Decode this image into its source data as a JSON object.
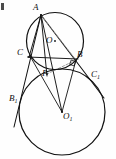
{
  "figure": {
    "background_color": "#fefefe",
    "stroke_color": "#111111",
    "dashed_color": "#8a8a8a",
    "corner_artifact": true,
    "circles": [
      {
        "name": "upper-circle",
        "center_label": "O",
        "cx": 55,
        "cy": 41,
        "r": 28.5,
        "stroke_width": 1.15
      },
      {
        "name": "lower-circle",
        "center_label": "O1",
        "cx": 62,
        "cy": 112,
        "r": 43,
        "stroke_width": 1.15
      }
    ],
    "points": [
      {
        "id": "A",
        "label": "A",
        "sub": "",
        "x": 41,
        "y": 15,
        "label_x": 34,
        "label_y": 4
      },
      {
        "id": "O",
        "label": "O",
        "sub": "",
        "x": 55,
        "y": 41,
        "label_x": 47,
        "label_y": 38
      },
      {
        "id": "C",
        "label": "C",
        "sub": "",
        "x": 30,
        "y": 56,
        "label_x": 19,
        "label_y": 48
      },
      {
        "id": "B",
        "label": "B",
        "sub": "",
        "x": 76,
        "y": 60,
        "label_x": 77,
        "label_y": 51
      },
      {
        "id": "C1",
        "label": "C",
        "sub": "1",
        "x": 90,
        "y": 74,
        "label_x": 92,
        "label_y": 69
      },
      {
        "id": "P",
        "label": "P",
        "sub": "",
        "x": 47,
        "y": 74,
        "label_x": 44,
        "label_y": 71
      },
      {
        "id": "B1",
        "label": "B",
        "sub": "1",
        "x": 19,
        "y": 99,
        "label_x": 10,
        "label_y": 95
      },
      {
        "id": "O1",
        "label": "O",
        "sub": "1",
        "x": 62,
        "y": 112,
        "label_x": 63,
        "label_y": 112
      }
    ],
    "segments": [
      {
        "name": "line-A-to-B1",
        "x1": 41,
        "y1": 15,
        "x2": 14,
        "y2": 127,
        "solid": true
      },
      {
        "name": "line-A-to-C1",
        "x1": 41,
        "y1": 15,
        "x2": 104,
        "y2": 98,
        "solid": true
      },
      {
        "name": "line-A-to-O1",
        "x1": 41,
        "y1": 15,
        "x2": 62,
        "y2": 112,
        "solid": true
      },
      {
        "name": "line-A-to-P",
        "x1": 41,
        "y1": 15,
        "x2": 47,
        "y2": 74,
        "solid": true
      },
      {
        "name": "line-A-to-C",
        "x1": 41,
        "y1": 15,
        "x2": 30,
        "y2": 56,
        "solid": true
      },
      {
        "name": "line-C-to-B",
        "x1": 28,
        "y1": 57,
        "x2": 78,
        "y2": 59,
        "solid": true
      },
      {
        "name": "line-A-to-B-dashed",
        "x1": 41,
        "y1": 15,
        "x2": 76,
        "y2": 60,
        "solid": false
      },
      {
        "name": "line-B-to-P-dashed",
        "x1": 76,
        "y1": 60,
        "x2": 47,
        "y2": 74,
        "solid": false
      },
      {
        "name": "line-C-to-O1",
        "x1": 30,
        "y1": 56,
        "x2": 62,
        "y2": 112,
        "solid": true
      },
      {
        "name": "line-B-to-O1",
        "x1": 76,
        "y1": 60,
        "x2": 62,
        "y2": 112,
        "solid": true
      }
    ],
    "right_angle": {
      "name": "right-angle-at-B",
      "x": 73,
      "y": 62,
      "size": 5.5
    }
  }
}
